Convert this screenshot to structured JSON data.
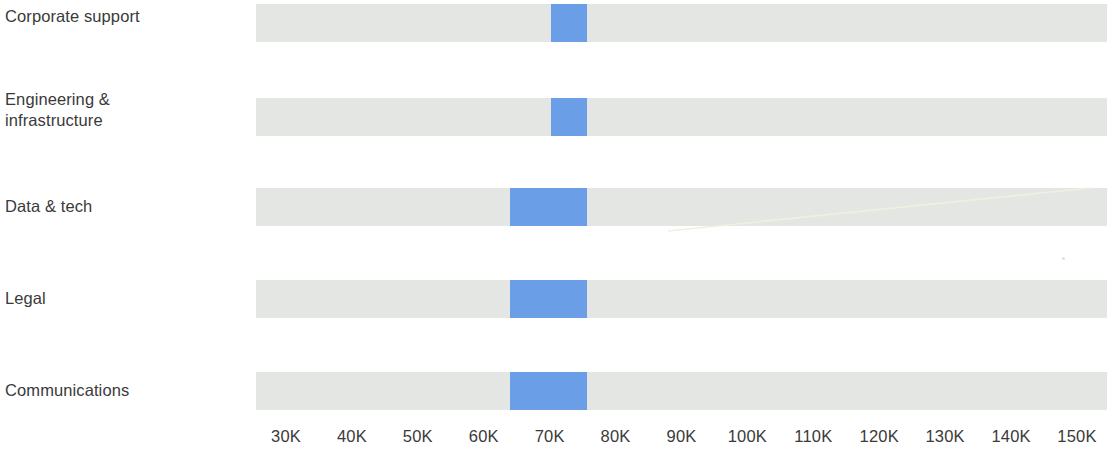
{
  "chart_data": {
    "type": "bar",
    "subtype": "range-bar",
    "title": "",
    "subtitle": "",
    "xlabel": "",
    "ylabel": "",
    "grid": false,
    "legend": null,
    "axis": {
      "min": 25000,
      "max": 155000,
      "tick_labels": [
        "30K",
        "40K",
        "50K",
        "60K",
        "70K",
        "80K",
        "90K",
        "100K",
        "110K",
        "120K",
        "130K",
        "140K",
        "150K"
      ],
      "tick_values": [
        30000,
        40000,
        50000,
        60000,
        70000,
        80000,
        90000,
        100000,
        110000,
        120000,
        130000,
        140000,
        150000
      ],
      "position": "bottom"
    },
    "colors": {
      "track": "#e3e6e2",
      "highlight": "#6a9fe8",
      "text": "#3a3a3a",
      "background": "#ffffff"
    },
    "categories": [
      "Corporate support",
      "Engineering &\ninfrastructure",
      "Data & tech",
      "Legal",
      "Communications"
    ],
    "series": [
      {
        "name": "Full range",
        "values": [
          [
            25500,
            154500
          ],
          [
            25500,
            154500
          ],
          [
            25500,
            154500
          ],
          [
            25500,
            154500
          ],
          [
            25500,
            154500
          ]
        ]
      },
      {
        "name": "Highlighted range",
        "values": [
          [
            70200,
            75600
          ],
          [
            70200,
            75600
          ],
          [
            64000,
            75600
          ],
          [
            64000,
            75600
          ],
          [
            64000,
            75600
          ]
        ]
      }
    ],
    "rows": [
      {
        "label": "Corporate support",
        "track_start": 25500,
        "track_end": 154500,
        "highlight_start": 70200,
        "highlight_end": 75600
      },
      {
        "label": "Engineering &\ninfrastructure",
        "track_start": 25500,
        "track_end": 154500,
        "highlight_start": 70200,
        "highlight_end": 75600
      },
      {
        "label": "Data & tech",
        "track_start": 25500,
        "track_end": 154500,
        "highlight_start": 64000,
        "highlight_end": 75600
      },
      {
        "label": "Legal",
        "track_start": 25500,
        "track_end": 154500,
        "highlight_start": 64000,
        "highlight_end": 75600
      },
      {
        "label": "Communications",
        "track_start": 25500,
        "track_end": 154500,
        "highlight_start": 64000,
        "highlight_end": 75600
      }
    ],
    "annotations": [
      {
        "name": "scan-artifact-diagonal",
        "type": "line",
        "note": "pale diagonal scan streak across the Data & tech row"
      },
      {
        "name": "scan-artifact-speck",
        "type": "dot",
        "note": "faint speck above the Legal row at the right edge"
      }
    ]
  }
}
